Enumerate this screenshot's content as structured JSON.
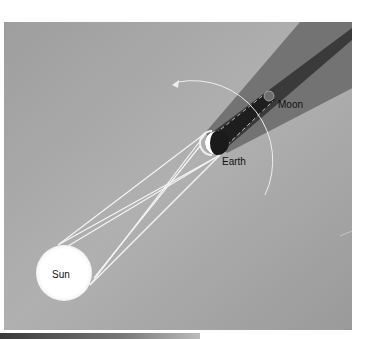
{
  "diagram": {
    "background": {
      "color_light": "#c2c2c2",
      "color_mid": "#a4a4a4",
      "color_dark": "#8f8f8f"
    },
    "bodies": [
      {
        "id": "sun",
        "label": "Sun",
        "cx": 64,
        "cy": 273,
        "r": 28,
        "fill": "#ffffff"
      },
      {
        "id": "earth",
        "label": "Earth",
        "cx": 217,
        "cy": 143,
        "r": 12,
        "fill": "#1c1c1c",
        "lit_fill": "#ffffff"
      },
      {
        "id": "moon",
        "label": "Moon",
        "cx": 270,
        "cy": 96,
        "r": 5,
        "fill": "#777777"
      }
    ],
    "regions": {
      "penumbra_color": "#6a6a6a",
      "umbra_color": "#2a2a2a"
    },
    "orbit": {
      "label": "Moon orbit direction",
      "stroke": "#eeeeee"
    },
    "labels": {
      "sun": "Sun",
      "earth": "Earth",
      "moon": "Moon"
    }
  }
}
